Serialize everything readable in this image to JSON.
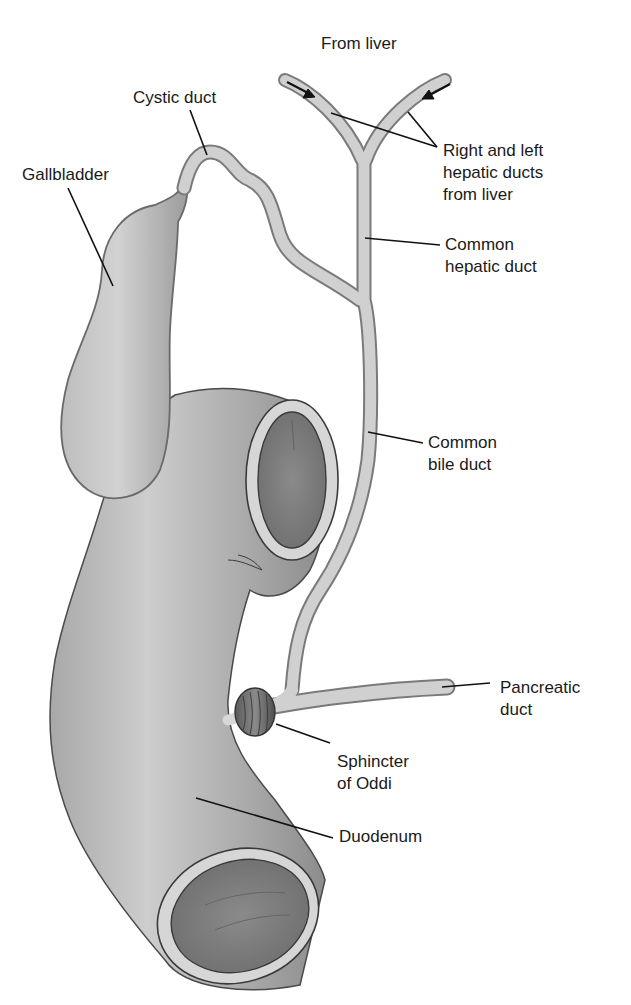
{
  "diagram": {
    "type": "anatomical illustration",
    "colors": {
      "background": "#ffffff",
      "organ_fill": "#b8b8b8",
      "organ_highlight": "#d4d4d4",
      "organ_shadow": "#8a8a8a",
      "lumen_fill": "#7c7c7c",
      "duct_fill": "#cfcfcf",
      "outline": "#555555",
      "leader_line": "#111111",
      "label_text": "#1a1a1a"
    },
    "labels": {
      "from_liver": "From liver",
      "cystic_duct": "Cystic duct",
      "gallbladder": "Gallbladder",
      "hepatic_ducts": "Right and left\nhepatic ducts\nfrom liver",
      "common_hepatic_duct": "Common\nhepatic duct",
      "common_bile_duct": "Common\nbile duct",
      "pancreatic_duct": "Pancreatic\nduct",
      "sphincter_of_oddi": "Sphincter\nof Oddi",
      "duodenum": "Duodenum"
    },
    "flow_arrows": [
      {
        "name": "right-hepatic-flow",
        "direction": "down-right"
      },
      {
        "name": "left-hepatic-flow",
        "direction": "down-left"
      }
    ]
  }
}
